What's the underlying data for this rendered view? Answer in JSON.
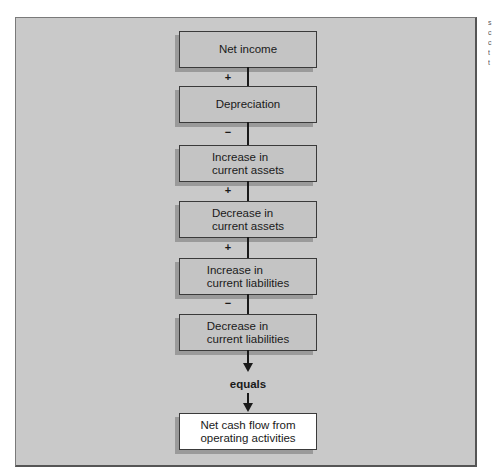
{
  "diagram": {
    "boxes": [
      {
        "id": "net-income",
        "line1": "Net income",
        "line2": ""
      },
      {
        "id": "depreciation",
        "line1": "Depreciation",
        "line2": ""
      },
      {
        "id": "increase-current-assets",
        "line1": "Increase in",
        "line2": "current assets"
      },
      {
        "id": "decrease-current-assets",
        "line1": "Decrease in",
        "line2": "current assets"
      },
      {
        "id": "increase-current-liabilities",
        "line1": "Increase in",
        "line2": "current liabilities"
      },
      {
        "id": "decrease-current-liabilities",
        "line1": "Decrease in",
        "line2": "current liabilities"
      }
    ],
    "signs": [
      "+",
      "−",
      "+",
      "+",
      "−"
    ],
    "equals_label": "equals",
    "result": {
      "line1": "Net cash flow from",
      "line2": "operating activities"
    },
    "side_text": [
      "s",
      "c",
      "c",
      "t",
      "t"
    ]
  }
}
